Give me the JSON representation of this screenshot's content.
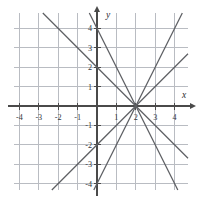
{
  "chart_data": {
    "type": "line",
    "title": "",
    "xlabel": "x",
    "ylabel": "y",
    "xlim": [
      -4.8,
      4.8
    ],
    "ylim": [
      -4.8,
      4.8
    ],
    "grid": true,
    "grid_step": 1,
    "legend": "none",
    "common_point": [
      2,
      0
    ],
    "xticks": [
      -4,
      -3,
      -2,
      -1,
      1,
      2,
      3,
      4
    ],
    "yticks": [
      4,
      3,
      2,
      1,
      -1,
      -2,
      -3,
      -4
    ],
    "xtick_labels": [
      "-4",
      "-3",
      "-2",
      "-1",
      "1",
      "2",
      "3",
      "4"
    ],
    "ytick_labels": [
      "4",
      "3",
      "2",
      "1",
      "-1",
      "-2",
      "-3",
      "-4"
    ],
    "series": [
      {
        "name": "line-slope-neg2",
        "slope": -2,
        "intercept": 4,
        "equation": "y = -2x + 4"
      },
      {
        "name": "line-slope-neg1",
        "slope": -1,
        "intercept": 2,
        "equation": "y = -x + 2"
      },
      {
        "name": "line-slope-pos1",
        "slope": 1,
        "intercept": -2,
        "equation": "y = x - 2"
      },
      {
        "name": "line-slope-pos2",
        "slope": 2,
        "intercept": -4,
        "equation": "y = 2x - 4"
      }
    ]
  },
  "axes": {
    "x_label": "x",
    "y_label": "y"
  }
}
